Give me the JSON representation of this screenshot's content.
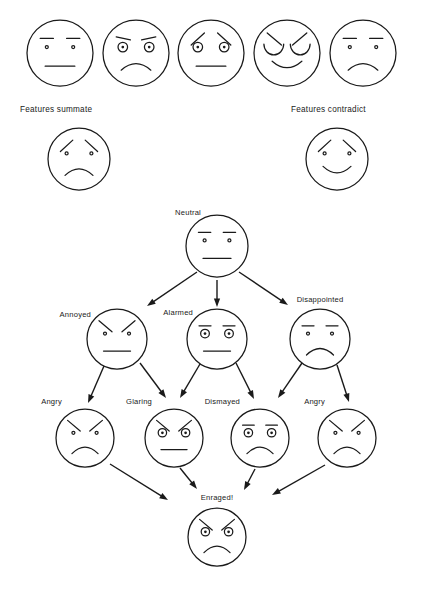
{
  "figure": {
    "background_color": "#ffffff",
    "ink_color": "#1a1a1a",
    "width": 423,
    "height": 592
  },
  "captions": {
    "summate": "Features summate",
    "contradict": "Features contradict"
  },
  "top_row": {
    "description": "Row of five schematic faces built from brow, eye and mouth features",
    "faces": [
      {
        "id": "top-face-1",
        "cx": 60,
        "cy": 53,
        "r": 33,
        "brows": "straight",
        "eyes": "dot",
        "mouth": "straight"
      },
      {
        "id": "top-face-2",
        "cx": 136,
        "cy": 53,
        "r": 33,
        "brows": "raised",
        "eyes": "ringed",
        "mouth": "frown"
      },
      {
        "id": "top-face-3",
        "cx": 211,
        "cy": 53,
        "r": 33,
        "brows": "worried",
        "eyes": "ringed",
        "mouth": "straight"
      },
      {
        "id": "top-face-4",
        "cx": 287,
        "cy": 53,
        "r": 33,
        "brows": "angry",
        "eyes": "arc",
        "mouth": "smile"
      },
      {
        "id": "top-face-5",
        "cx": 363,
        "cy": 53,
        "r": 33,
        "brows": "straight",
        "eyes": "dot",
        "mouth": "frown"
      }
    ]
  },
  "second_row": {
    "faces": [
      {
        "id": "summate-face",
        "cx": 79,
        "cy": 159,
        "r": 31,
        "brows": "worried",
        "eyes": "dot",
        "mouth": "frown"
      },
      {
        "id": "contradict-face",
        "cx": 337,
        "cy": 159,
        "r": 31,
        "brows": "worried",
        "eyes": "dot",
        "mouth": "smile"
      }
    ]
  },
  "flowchart": {
    "levels": [
      {
        "name": "level-1",
        "nodes": [
          {
            "id": "neutral",
            "label": "Neutral",
            "cx": 217,
            "cy": 246,
            "r": 31,
            "brows": "straight",
            "eyes": "dot",
            "mouth": "straight",
            "label_x": 201,
            "label_y": 215,
            "label_anchor": "end"
          }
        ]
      },
      {
        "name": "level-2",
        "nodes": [
          {
            "id": "annoyed",
            "label": "Annoyed",
            "cx": 117,
            "cy": 339,
            "r": 30,
            "brows": "angry",
            "eyes": "dot",
            "mouth": "straight",
            "label_x": 91,
            "label_y": 317,
            "label_anchor": "end"
          },
          {
            "id": "alarmed",
            "label": "Alarmed",
            "cx": 217,
            "cy": 339,
            "r": 30,
            "brows": "straight",
            "eyes": "ringed",
            "mouth": "straight",
            "label_x": 193,
            "label_y": 315,
            "label_anchor": "end"
          },
          {
            "id": "disappointed",
            "label": "Disappointed",
            "cx": 320,
            "cy": 339,
            "r": 30,
            "brows": "straight",
            "eyes": "dot",
            "mouth": "frown",
            "label_x": 320,
            "label_y": 302,
            "label_anchor": "middle"
          }
        ]
      },
      {
        "name": "level-3",
        "nodes": [
          {
            "id": "angry-left",
            "label": "Angry",
            "cx": 85,
            "cy": 438,
            "r": 29,
            "brows": "angry",
            "eyes": "dot",
            "mouth": "frown",
            "label_x": 62,
            "label_y": 404,
            "label_anchor": "end"
          },
          {
            "id": "glaring",
            "label": "Glaring",
            "cx": 174,
            "cy": 438,
            "r": 29,
            "brows": "angry",
            "eyes": "ringed",
            "mouth": "straight",
            "label_x": 152,
            "label_y": 404,
            "label_anchor": "end"
          },
          {
            "id": "dismayed",
            "label": "Dismayed",
            "cx": 260,
            "cy": 438,
            "r": 29,
            "brows": "straight",
            "eyes": "ringed",
            "mouth": "frown",
            "label_x": 240,
            "label_y": 404,
            "label_anchor": "end"
          },
          {
            "id": "angry-right",
            "label": "Angry",
            "cx": 347,
            "cy": 438,
            "r": 29,
            "brows": "angry",
            "eyes": "dot",
            "mouth": "frown",
            "label_x": 325,
            "label_y": 404,
            "label_anchor": "end"
          }
        ]
      },
      {
        "name": "level-4",
        "nodes": [
          {
            "id": "enraged",
            "label": "Enraged!",
            "cx": 217,
            "cy": 537,
            "r": 29,
            "brows": "angry",
            "eyes": "ringed",
            "mouth": "frown",
            "label_x": 217,
            "label_y": 500,
            "label_anchor": "middle"
          }
        ]
      }
    ],
    "arrows": [
      {
        "from": "neutral",
        "to": "annoyed",
        "x1": 197,
        "y1": 272,
        "x2": 147,
        "y2": 306
      },
      {
        "from": "neutral",
        "to": "alarmed",
        "x1": 217,
        "y1": 280,
        "x2": 217,
        "y2": 307
      },
      {
        "from": "neutral",
        "to": "disappointed",
        "x1": 239,
        "y1": 272,
        "x2": 288,
        "y2": 305
      },
      {
        "from": "annoyed",
        "to": "angry-left",
        "x1": 104,
        "y1": 366,
        "x2": 88,
        "y2": 403
      },
      {
        "from": "annoyed",
        "to": "glaring",
        "x1": 140,
        "y1": 363,
        "x2": 166,
        "y2": 398
      },
      {
        "from": "alarmed",
        "to": "glaring",
        "x1": 200,
        "y1": 364,
        "x2": 180,
        "y2": 398
      },
      {
        "from": "alarmed",
        "to": "dismayed",
        "x1": 236,
        "y1": 363,
        "x2": 254,
        "y2": 399
      },
      {
        "from": "disappointed",
        "to": "dismayed",
        "x1": 302,
        "y1": 363,
        "x2": 278,
        "y2": 398
      },
      {
        "from": "disappointed",
        "to": "angry-right",
        "x1": 337,
        "y1": 365,
        "x2": 349,
        "y2": 402
      },
      {
        "from": "angry-left",
        "to": "enraged",
        "x1": 110,
        "y1": 464,
        "x2": 168,
        "y2": 500
      },
      {
        "from": "glaring",
        "to": "enraged",
        "x1": 180,
        "y1": 468,
        "x2": 197,
        "y2": 489
      },
      {
        "from": "dismayed",
        "to": "enraged",
        "x1": 255,
        "y1": 469,
        "x2": 244,
        "y2": 490
      },
      {
        "from": "angry-right",
        "to": "enraged",
        "x1": 325,
        "y1": 465,
        "x2": 272,
        "y2": 495
      }
    ]
  }
}
